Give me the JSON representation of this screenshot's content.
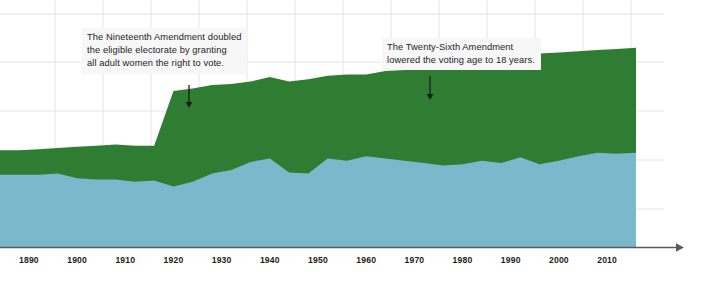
{
  "chart_data": {
    "type": "area",
    "title": "",
    "subtitle": "",
    "xlabel": "",
    "ylabel": "",
    "stacked": true,
    "grid": true,
    "legend_position": "none",
    "xlim": [
      1884,
      2016
    ],
    "ylim": [
      0,
      100
    ],
    "xticks": [
      "1890",
      "1900",
      "1910",
      "1920",
      "1930",
      "1940",
      "1950",
      "1960",
      "1970",
      "1980",
      "1990",
      "2000",
      "2010"
    ],
    "x": [
      1884,
      1888,
      1892,
      1896,
      1900,
      1904,
      1908,
      1912,
      1916,
      1920,
      1924,
      1928,
      1932,
      1936,
      1940,
      1944,
      1948,
      1952,
      1956,
      1960,
      1964,
      1968,
      1972,
      1976,
      1980,
      1984,
      1988,
      1992,
      1996,
      2000,
      2004,
      2008,
      2012,
      2016
    ],
    "series": [
      {
        "name": "voted",
        "color": "#7cb8cb",
        "values": [
          31.0,
          31.0,
          31.0,
          31.5,
          29.5,
          29.0,
          29.0,
          28.0,
          28.5,
          26.0,
          28.0,
          31.5,
          33.0,
          36.5,
          38.0,
          32.0,
          31.5,
          38.0,
          37.0,
          39.0,
          38.0,
          37.0,
          36.0,
          35.0,
          35.5,
          37.0,
          36.0,
          38.5,
          35.5,
          37.0,
          39.0,
          40.5,
          40.0,
          40.5
        ]
      },
      {
        "name": "eligible-not-voted",
        "color": "#2e7d32",
        "values": [
          10.5,
          10.5,
          11.0,
          11.0,
          13.5,
          14.5,
          15.0,
          15.5,
          15.0,
          41.0,
          40.0,
          38.0,
          37.0,
          34.5,
          35.0,
          39.0,
          40.5,
          35.5,
          37.0,
          35.0,
          37.5,
          39.0,
          43.0,
          44.5,
          44.0,
          43.5,
          45.5,
          44.0,
          47.5,
          46.5,
          45.0,
          44.0,
          45.0,
          45.0
        ]
      }
    ],
    "annotations": [
      {
        "id": "nineteenth-amendment",
        "text": "The Nineteenth Amendment doubled\nthe eligible electorate by granting\nall adult women the right to vote.",
        "arrow_x": 189,
        "arrow_y_start": 85,
        "arrow_y_end": 108
      },
      {
        "id": "twenty-sixth-amendment",
        "text": "The Twenty-Sixth Amendment\nlowered the voting age to 18 years.",
        "arrow_x": 430,
        "arrow_y_start": 76,
        "arrow_y_end": 100
      }
    ],
    "colors": {
      "voted": "#7cb8cb",
      "eligible_not_voted": "#2e7d32",
      "gridline": "#e4e4e4",
      "axis": "#5a5a5a",
      "annotation_background": "#f7f7f7",
      "text": "#1c1c1c"
    }
  }
}
